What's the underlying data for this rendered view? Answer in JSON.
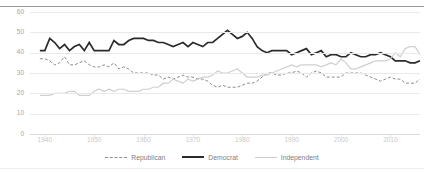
{
  "chart": {
    "title": "",
    "y_axis": {
      "label": "",
      "ticks": [
        "0",
        "10",
        "20",
        "30",
        "40",
        "50",
        "60"
      ],
      "min": 0,
      "max": 60
    },
    "x_axis": {
      "label": "",
      "ticks": [
        "1940",
        "1950",
        "1960",
        "1970",
        "1980",
        "1990",
        "2000",
        "2010"
      ],
      "min": 1937,
      "max": 2016
    },
    "legend": {
      "position": "bottom",
      "items": [
        {
          "label": "Republican",
          "style": "dashed",
          "color": "#8c8c8c"
        },
        {
          "label": "Democrat",
          "style": "solid-thick",
          "color": "#2b2b2b"
        },
        {
          "label": "Independent",
          "style": "solid-light",
          "color": "#cfcfcf"
        }
      ]
    }
  },
  "chart_data": {
    "type": "line",
    "xlabel": "",
    "ylabel": "",
    "xlim": [
      1937,
      2016
    ],
    "ylim": [
      0,
      60
    ],
    "yticks": [
      0,
      10,
      20,
      30,
      40,
      50,
      60
    ],
    "xticks": [
      1940,
      1950,
      1960,
      1970,
      1980,
      1990,
      2000,
      2010
    ],
    "grid": true,
    "legend_position": "bottom",
    "x": [
      1939,
      1940,
      1941,
      1942,
      1943,
      1944,
      1945,
      1946,
      1947,
      1948,
      1949,
      1950,
      1951,
      1952,
      1953,
      1954,
      1955,
      1956,
      1957,
      1958,
      1959,
      1960,
      1961,
      1962,
      1963,
      1964,
      1965,
      1966,
      1967,
      1968,
      1969,
      1970,
      1971,
      1972,
      1973,
      1974,
      1975,
      1976,
      1977,
      1978,
      1979,
      1980,
      1981,
      1982,
      1983,
      1984,
      1985,
      1986,
      1987,
      1988,
      1989,
      1990,
      1991,
      1992,
      1993,
      1994,
      1995,
      1996,
      1997,
      1998,
      1999,
      2000,
      2001,
      2002,
      2003,
      2004,
      2005,
      2006,
      2007,
      2008,
      2009,
      2010,
      2011,
      2012,
      2013,
      2014,
      2015,
      2016
    ],
    "series": [
      {
        "name": "Democrat",
        "style": "solid-thick",
        "color": "#2b2b2b",
        "values": [
          41,
          41,
          47,
          45,
          42,
          44,
          41,
          43,
          44,
          41,
          45,
          41,
          41,
          41,
          41,
          46,
          44,
          44,
          46,
          47,
          47,
          47,
          46,
          46,
          45,
          45,
          44,
          43,
          44,
          45,
          43,
          45,
          44,
          43,
          45,
          45,
          47,
          49,
          51,
          49,
          47,
          48,
          50,
          47,
          43,
          41,
          40,
          41,
          41,
          41,
          41,
          39,
          40,
          41,
          42,
          39,
          40,
          41,
          38,
          39,
          39,
          38,
          38,
          40,
          39,
          38,
          38,
          39,
          39,
          40,
          39,
          38,
          36,
          36,
          36,
          35,
          35,
          36
        ]
      },
      {
        "name": "Republican",
        "style": "dashed",
        "color": "#8c8c8c",
        "values": [
          37,
          37,
          36,
          34,
          35,
          38,
          34,
          34,
          35,
          36,
          34,
          33,
          33,
          34,
          33,
          35,
          32,
          33,
          32,
          30,
          30,
          30,
          30,
          29,
          29,
          27,
          28,
          27,
          28,
          29,
          28,
          28,
          27,
          27,
          26,
          24,
          23,
          24,
          23,
          23,
          23,
          24,
          25,
          25,
          26,
          28,
          30,
          30,
          29,
          29,
          30,
          30,
          31,
          30,
          28,
          30,
          31,
          30,
          28,
          28,
          28,
          28,
          30,
          30,
          30,
          30,
          29,
          28,
          27,
          26,
          27,
          28,
          27,
          27,
          25,
          25,
          25,
          27
        ]
      },
      {
        "name": "Independent",
        "style": "solid-light",
        "color": "#cfcfcf",
        "values": [
          19,
          19,
          19,
          20,
          20,
          20,
          21,
          21,
          19,
          19,
          19,
          21,
          22,
          21,
          22,
          21,
          22,
          22,
          21,
          21,
          21,
          22,
          22,
          23,
          23,
          25,
          25,
          27,
          26,
          25,
          27,
          26,
          27,
          28,
          28,
          29,
          31,
          30,
          30,
          31,
          32,
          30,
          28,
          28,
          28,
          29,
          29,
          30,
          31,
          32,
          33,
          34,
          33,
          34,
          34,
          34,
          34,
          33,
          34,
          35,
          34,
          37,
          35,
          32,
          32,
          33,
          34,
          35,
          36,
          36,
          36,
          37,
          40,
          38,
          42,
          43,
          43,
          39
        ]
      }
    ]
  }
}
